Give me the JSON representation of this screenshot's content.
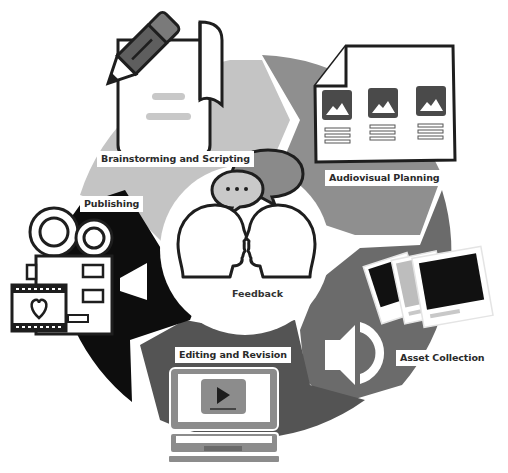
{
  "diagram": {
    "type": "cycle",
    "center": {
      "label": "Feedback",
      "icon": "two-heads-speech-bubbles-icon"
    },
    "stages": [
      {
        "label": "Brainstorming and Scripting",
        "icon": "pencil-scroll-icon",
        "color": "#c4c4c4"
      },
      {
        "label": "Audiovisual Planning",
        "icon": "storyboard-icon",
        "color": "#8f8f8f"
      },
      {
        "label": "Asset Collection",
        "icon": "photos-speaker-icon",
        "color": "#6b6b6b"
      },
      {
        "label": "Editing and Revision",
        "icon": "laptop-play-icon",
        "color": "#545454"
      },
      {
        "label": "Publishing",
        "icon": "movie-camera-film-icon",
        "color": "#0d0d0d"
      }
    ],
    "colors": {
      "background": "#ffffff",
      "outline": "#1e1e1e",
      "center": "#ffffff"
    }
  }
}
